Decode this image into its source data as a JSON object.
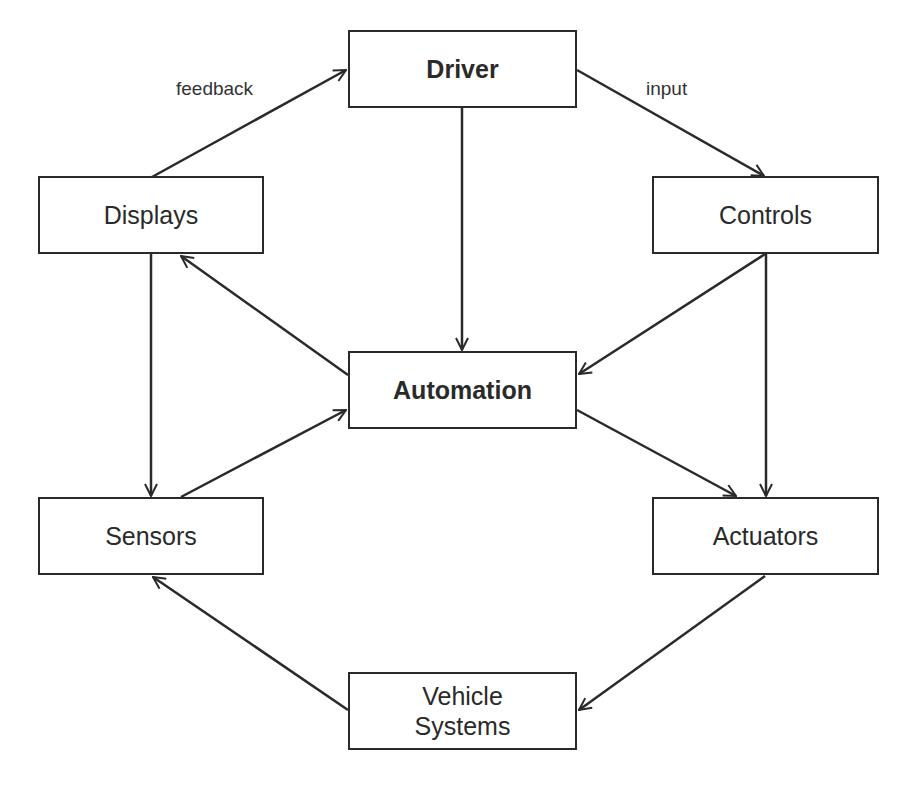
{
  "diagram": {
    "nodes": {
      "driver": {
        "label": "Driver",
        "bold": true
      },
      "displays": {
        "label": "Displays"
      },
      "controls": {
        "label": "Controls"
      },
      "automation": {
        "label": "Automation",
        "bold": true
      },
      "sensors": {
        "label": "Sensors"
      },
      "actuators": {
        "label": "Actuators"
      },
      "vehicle_systems": {
        "label_line1": "Vehicle",
        "label_line2": "Systems"
      }
    },
    "edge_labels": {
      "feedback": "feedback",
      "input": "input"
    },
    "edges": [
      {
        "from": "Displays",
        "to": "Driver",
        "label": "feedback"
      },
      {
        "from": "Driver",
        "to": "Controls",
        "label": "input"
      },
      {
        "from": "Driver",
        "to": "Automation"
      },
      {
        "from": "Automation",
        "to": "Displays"
      },
      {
        "from": "Controls",
        "to": "Automation"
      },
      {
        "from": "Displays",
        "to": "Sensors"
      },
      {
        "from": "Controls",
        "to": "Actuators"
      },
      {
        "from": "Sensors",
        "to": "Automation"
      },
      {
        "from": "Automation",
        "to": "Actuators"
      },
      {
        "from": "Actuators",
        "to": "Vehicle Systems"
      },
      {
        "from": "Vehicle Systems",
        "to": "Sensors"
      }
    ],
    "colors": {
      "stroke": "#2a2a2a",
      "background": "#ffffff"
    }
  }
}
